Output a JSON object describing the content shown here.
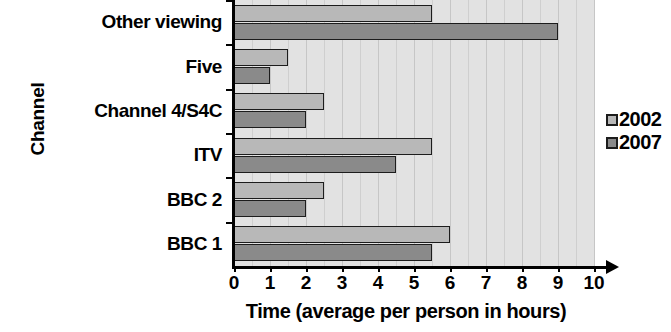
{
  "chart_data": {
    "type": "bar",
    "orientation": "horizontal",
    "title": "",
    "xlabel": "Time (average per person in hours)",
    "ylabel": "Channel",
    "categories": [
      "BBC 1",
      "BBC 2",
      "ITV",
      "Channel 4/S4C",
      "Five",
      "Other viewing"
    ],
    "series": [
      {
        "name": "2002",
        "color": "#b8b8b8",
        "values": [
          6.0,
          2.5,
          5.5,
          2.5,
          1.5,
          5.5
        ]
      },
      {
        "name": "2007",
        "color": "#8a8a8a",
        "values": [
          5.5,
          2.0,
          4.5,
          2.0,
          1.0,
          9.0
        ]
      }
    ],
    "xlim": [
      0,
      10
    ],
    "xticks": [
      0,
      1,
      2,
      3,
      4,
      5,
      6,
      7,
      8,
      9,
      10
    ],
    "xtick_labels": [
      "0",
      "1",
      "2",
      "3",
      "4",
      "5",
      "6",
      "7",
      "8",
      "9",
      "10"
    ],
    "grid": true,
    "grid_interval": 0.5,
    "legend_position": "right",
    "plot_background": "#e2e2e2",
    "bar_edge_color": "#1c1c1c"
  },
  "legend": {
    "entries": [
      {
        "label": "2002",
        "swatch": "legend-swatch-2002"
      },
      {
        "label": "2007",
        "swatch": "legend-swatch-2007"
      }
    ]
  }
}
